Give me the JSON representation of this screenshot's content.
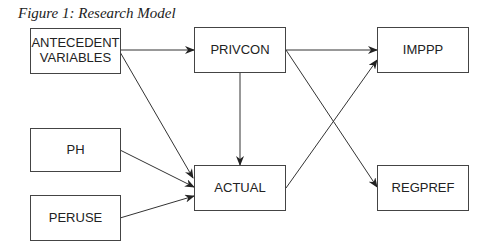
{
  "caption": "Figure 1: Research Model",
  "nodes": {
    "antecedent": {
      "line1": "ANTECEDENT",
      "line2": "VARIABLES"
    },
    "privcon": "PRIVCON",
    "imppp": "IMPPP",
    "ph": "PH",
    "actual": "ACTUAL",
    "peruse": "PERUSE",
    "regpref": "REGPREF"
  },
  "edges": [
    {
      "from": "ANTECEDENT VARIABLES",
      "to": "PRIVCON"
    },
    {
      "from": "ANTECEDENT VARIABLES",
      "to": "ACTUAL"
    },
    {
      "from": "PRIVCON",
      "to": "IMPPP"
    },
    {
      "from": "PRIVCON",
      "to": "ACTUAL"
    },
    {
      "from": "PRIVCON",
      "to": "REGPREF"
    },
    {
      "from": "PH",
      "to": "ACTUAL"
    },
    {
      "from": "PERUSE",
      "to": "ACTUAL"
    },
    {
      "from": "ACTUAL",
      "to": "IMPPP"
    }
  ]
}
